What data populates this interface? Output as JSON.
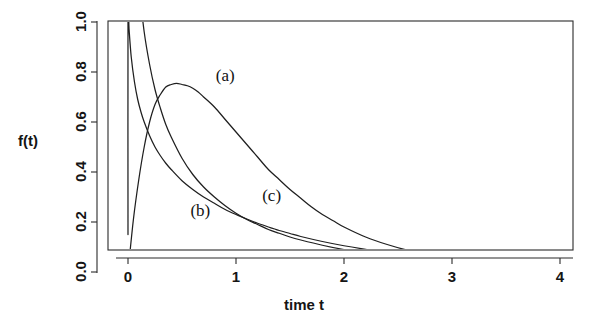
{
  "figure": {
    "width": 612,
    "height": 330,
    "background": "#ffffff",
    "ink_color": "#1f1f1f"
  },
  "chart_data": {
    "type": "line",
    "title": "",
    "subtitle": "",
    "xlabel": "time t",
    "ylabel": "f(t)",
    "xlim": [
      -0.18,
      4.3
    ],
    "ylim": [
      -0.05,
      1.04
    ],
    "xticks": [
      0,
      1,
      2,
      3,
      4
    ],
    "xtick_labels": [
      "0",
      "1",
      "2",
      "3",
      "4"
    ],
    "yticks": [
      0.0,
      0.2,
      0.4,
      0.6,
      0.8,
      1.0
    ],
    "ytick_labels": [
      "0.0",
      "0.2",
      "0.4",
      "0.6",
      "0.8",
      "1.0"
    ],
    "grid": false,
    "legend_position": "inline-annotations",
    "frame": "box",
    "ytick_label_rotation": -90,
    "annotations": [
      {
        "text": "(a)",
        "x": 0.9,
        "y": 0.78
      },
      {
        "text": "(b)",
        "x": 0.67,
        "y": 0.24
      },
      {
        "text": "(c)",
        "x": 1.33,
        "y": 0.3
      }
    ],
    "series": [
      {
        "name": "(a)",
        "label": "(a)",
        "color": "#1f1f1f",
        "x": [
          0.0,
          0.05,
          0.1,
          0.15,
          0.2,
          0.25,
          0.3,
          0.35,
          0.4,
          0.45,
          0.5,
          0.55,
          0.6,
          0.65,
          0.7,
          0.8,
          0.9,
          1.0,
          1.1,
          1.2,
          1.3,
          1.4,
          1.5,
          1.6,
          1.7,
          1.8,
          1.9,
          2.0,
          2.2,
          2.4,
          2.6,
          2.8,
          3.0,
          3.2,
          3.4,
          3.6,
          3.8,
          4.0,
          4.3
        ],
        "values": [
          0.0,
          0.21,
          0.37,
          0.5,
          0.6,
          0.67,
          0.71,
          0.74,
          0.75,
          0.755,
          0.75,
          0.745,
          0.735,
          0.72,
          0.7,
          0.66,
          0.61,
          0.56,
          0.51,
          0.46,
          0.41,
          0.37,
          0.33,
          0.295,
          0.26,
          0.23,
          0.205,
          0.18,
          0.14,
          0.11,
          0.086,
          0.068,
          0.055,
          0.046,
          0.04,
          0.036,
          0.033,
          0.031,
          0.029
        ]
      },
      {
        "name": "(b)",
        "label": "(b)",
        "color": "#1f1f1f",
        "x": [
          0.0,
          0.02,
          0.04,
          0.06,
          0.08,
          0.1,
          0.15,
          0.2,
          0.25,
          0.3,
          0.35,
          0.4,
          0.5,
          0.6,
          0.7,
          0.8,
          0.9,
          1.0,
          1.1,
          1.2,
          1.3,
          1.4,
          1.5,
          1.6,
          1.8,
          2.0,
          2.2,
          2.4,
          2.6,
          2.8,
          3.0,
          3.2,
          3.4,
          3.6,
          3.8,
          4.0,
          4.3
        ],
        "values": [
          2.1,
          1.78,
          1.55,
          1.38,
          1.25,
          1.15,
          0.96,
          0.83,
          0.73,
          0.655,
          0.59,
          0.54,
          0.455,
          0.39,
          0.34,
          0.3,
          0.265,
          0.235,
          0.21,
          0.19,
          0.17,
          0.155,
          0.14,
          0.128,
          0.107,
          0.09,
          0.077,
          0.066,
          0.058,
          0.051,
          0.046,
          0.042,
          0.039,
          0.036,
          0.034,
          0.033,
          0.031
        ]
      },
      {
        "name": "(c)",
        "label": "(c)",
        "color": "#1f1f1f",
        "x": [
          0.0,
          0.0,
          0.01,
          0.03,
          0.06,
          0.09,
          0.12,
          0.15,
          0.2,
          0.25,
          0.3,
          0.35,
          0.4,
          0.5,
          0.6,
          0.7,
          0.8,
          0.9,
          1.0,
          1.1,
          1.2,
          1.3,
          1.4,
          1.5,
          1.6,
          1.8,
          2.0,
          2.2,
          2.4,
          2.6,
          2.8,
          3.0,
          3.2,
          3.4,
          3.6,
          3.8,
          4.0,
          4.3
        ],
        "values": [
          0.15,
          1.04,
          0.97,
          0.86,
          0.76,
          0.69,
          0.64,
          0.6,
          0.545,
          0.5,
          0.465,
          0.435,
          0.41,
          0.365,
          0.33,
          0.3,
          0.275,
          0.25,
          0.23,
          0.212,
          0.195,
          0.18,
          0.166,
          0.154,
          0.142,
          0.122,
          0.105,
          0.091,
          0.08,
          0.071,
          0.064,
          0.058,
          0.054,
          0.05,
          0.047,
          0.045,
          0.043,
          0.041
        ]
      }
    ]
  }
}
